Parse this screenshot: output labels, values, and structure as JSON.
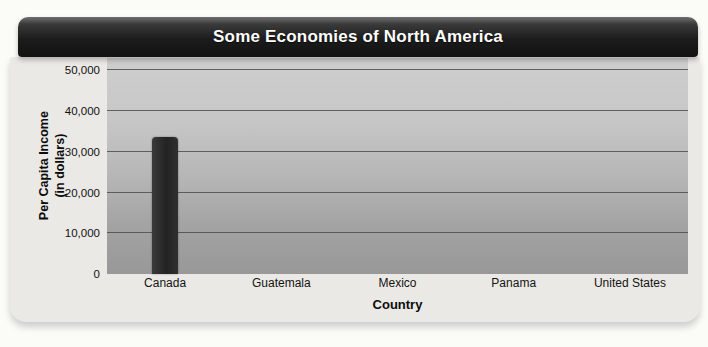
{
  "chart_data": {
    "type": "bar",
    "title": "Some Economies of North America",
    "xlabel": "Country",
    "ylabel": "Per Capita Income (in dollars)",
    "ylabel_line1": "Per Capita Income",
    "ylabel_line2": "(in dollars)",
    "categories": [
      "Canada",
      "Guatemala",
      "Mexico",
      "Panama",
      "United States"
    ],
    "values": [
      33500,
      null,
      null,
      null,
      null
    ],
    "yticks": [
      0,
      10000,
      20000,
      30000,
      40000,
      50000
    ],
    "ytick_labels": [
      "0",
      "10,000",
      "20,000",
      "30,000",
      "40,000",
      "50,000"
    ],
    "ylim": [
      0,
      53000
    ],
    "grid": "horizontal",
    "legend": "none"
  },
  "colors": {
    "title_bar": "#1c1c1c",
    "title_text": "#ffffff",
    "card_bg": "#ebe9e5",
    "plot_bg_top": "#cecece",
    "plot_bg_bottom": "#989898",
    "gridline": "#4d4d4d",
    "bar": "#2b2b2b",
    "page_bg": "#fbfbf8"
  }
}
